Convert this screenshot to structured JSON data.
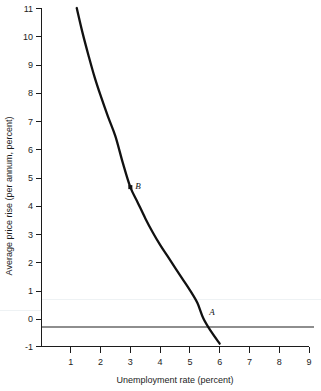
{
  "chart_data": {
    "type": "line",
    "title": "",
    "xlabel": "Unemployment rate (percent)",
    "ylabel": "Average price rise (per annum, percent)",
    "xlim": [
      0,
      9
    ],
    "ylim": [
      -1,
      11
    ],
    "grid": false,
    "legend": null,
    "xticks": [
      1,
      2,
      3,
      4,
      5,
      6,
      7,
      8,
      9
    ],
    "xtick_labels": [
      "1",
      "2",
      "3",
      "4",
      "5",
      "6",
      "7",
      "8",
      "9"
    ],
    "yticks": [
      -1,
      0,
      1,
      2,
      3,
      4,
      5,
      6,
      7,
      8,
      9,
      10,
      11
    ],
    "ytick_labels": [
      "-1",
      "0",
      "1",
      "2",
      "3",
      "4",
      "5",
      "6",
      "7",
      "8",
      "9",
      "10",
      "11"
    ],
    "series": [
      {
        "name": "Phillips curve",
        "x": [
          1.2,
          1.4,
          1.6,
          1.8,
          2.0,
          2.25,
          2.5,
          2.75,
          3.0,
          3.25,
          3.5,
          3.75,
          4.0,
          4.25,
          4.5,
          4.75,
          5.0,
          5.25,
          5.45,
          5.7,
          6.0
        ],
        "y": [
          11.0,
          10.1,
          9.3,
          8.55,
          7.9,
          7.15,
          6.45,
          5.5,
          4.65,
          4.1,
          3.55,
          3.05,
          2.6,
          2.2,
          1.8,
          1.4,
          1.0,
          0.55,
          0.0,
          -0.45,
          -0.9
        ]
      }
    ],
    "annotations": [
      {
        "label": "B",
        "x": 3.0,
        "y": 4.65,
        "marker": true
      },
      {
        "label": "A",
        "x": 5.45,
        "y": 0.0,
        "marker": false
      }
    ],
    "reference_lines": [
      {
        "name": "zero-inflation-line",
        "axis": "y",
        "value": 0,
        "color": "#8e8e8e"
      }
    ]
  },
  "axis": {
    "x_title": "Unemployment rate (percent)",
    "y_title": "Average price rise (per annum, percent)"
  },
  "colors": {
    "curve": "#111111",
    "axis": "#1c1c1c",
    "zero_line": "#8e8e8e",
    "background": "#ffffff"
  }
}
